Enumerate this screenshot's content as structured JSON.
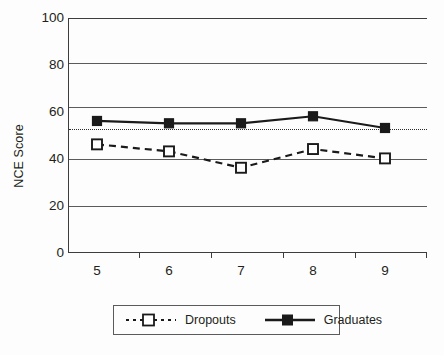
{
  "chart_data": {
    "type": "line",
    "title": "",
    "subtitle": "",
    "xlabel": "",
    "ylabel": "NCE Score",
    "x": [
      5,
      6,
      7,
      8,
      9
    ],
    "categories": [
      "5",
      "6",
      "7",
      "8",
      "9"
    ],
    "ylim": [
      0,
      100
    ],
    "xlim": [
      4.6,
      9.4
    ],
    "grid": true,
    "grid_axis": "y",
    "y_ticks": [
      0,
      20,
      40,
      60,
      80,
      100
    ],
    "y_tick_labels": [
      "0",
      "20",
      "40",
      "60",
      "80",
      "100"
    ],
    "x_tick_labels": [
      "5",
      "6",
      "7",
      "8",
      "9"
    ],
    "legend_position": "bottom-center",
    "reference_line": {
      "value": 50,
      "style": "dotted",
      "color": "#2b2b2b",
      "label": ""
    },
    "series": [
      {
        "name": "Dropouts",
        "values": [
          46,
          43,
          36,
          44,
          40
        ],
        "line_style": "dashed",
        "marker": "open-square",
        "color": "#1a1a1a"
      },
      {
        "name": "Graduates",
        "values": [
          56,
          55,
          55,
          58,
          53
        ],
        "line_style": "solid",
        "marker": "filled-square",
        "color": "#1a1a1a"
      }
    ]
  },
  "legend": {
    "entries": [
      {
        "label": "Dropouts",
        "marker": "open-square",
        "line_style": "dashed"
      },
      {
        "label": "Graduates",
        "marker": "filled-square",
        "line_style": "solid"
      }
    ]
  },
  "colors": {
    "axis": "#3d3d3d",
    "gridline": "#5b5b5b",
    "series": "#1a1a1a",
    "text": "#231f20",
    "background": "#fdfdfd"
  }
}
